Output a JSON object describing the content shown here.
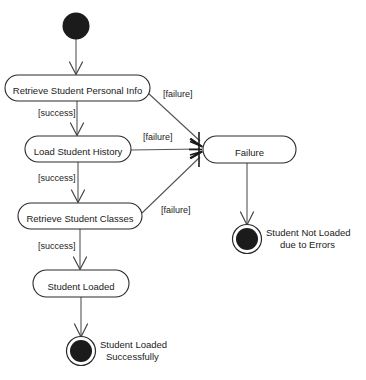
{
  "diagram": {
    "type": "uml-activity-diagram",
    "colors": {
      "background": "#ffffff",
      "node_fill": "#ffffff",
      "node_stroke": "#2a2a2a",
      "flow_stroke": "#555555",
      "solid_node": "#1b1b1b",
      "text": "#1a1a1a"
    },
    "start_node": {
      "name": "initial-node",
      "cx": 76,
      "cy": 26,
      "r": 13.5
    },
    "activities": [
      {
        "id": "retrieve-personal-info",
        "label": "Retrieve Student Personal Info",
        "x": 5,
        "y": 75,
        "w": 145,
        "h": 26
      },
      {
        "id": "load-student-history",
        "label": "Load Student History",
        "x": 25,
        "y": 136,
        "w": 106,
        "h": 26
      },
      {
        "id": "retrieve-student-classes",
        "label": "Retrieve Student Classes",
        "x": 18,
        "y": 203,
        "w": 124,
        "h": 26
      },
      {
        "id": "student-loaded",
        "label": "Student Loaded",
        "x": 33,
        "y": 270,
        "w": 96,
        "h": 27
      },
      {
        "id": "failure",
        "label": "Failure",
        "x": 203,
        "y": 136,
        "w": 93,
        "h": 27
      }
    ],
    "guards": [
      {
        "id": "guard-failure-1",
        "label": "[failure]",
        "x": 163,
        "y": 97
      },
      {
        "id": "guard-success-1",
        "label": "[success]",
        "x": 38,
        "y": 116
      },
      {
        "id": "guard-failure-2",
        "label": "[failure]",
        "x": 143,
        "y": 140
      },
      {
        "id": "guard-success-2",
        "label": "[success]",
        "x": 38,
        "y": 181
      },
      {
        "id": "guard-failure-3",
        "label": "[failure]",
        "x": 161,
        "y": 213
      },
      {
        "id": "guard-success-3",
        "label": "[success]",
        "x": 38,
        "y": 249
      }
    ],
    "end_nodes": [
      {
        "id": "end-error",
        "label_line1": "Student Not Loaded",
        "label_line2": "due to Errors",
        "cx": 247,
        "cy": 239,
        "r_outer": 14.5,
        "r_inner": 11,
        "label_x": 266,
        "label_y1": 236,
        "label_y2": 248
      },
      {
        "id": "end-success",
        "label_line1": "Student Loaded",
        "label_line2": "Successfully",
        "cx": 81,
        "cy": 351,
        "r_outer": 14.5,
        "r_inner": 11,
        "label_x": 100,
        "label_y1": 348,
        "label_y2": 360
      }
    ],
    "flows": [
      {
        "id": "flow-start-to-personal-info",
        "from": "initial-node",
        "to": "retrieve-personal-info",
        "guard": ""
      },
      {
        "id": "flow-personal-info-to-failure",
        "from": "retrieve-personal-info",
        "to": "failure",
        "guard": "[failure]"
      },
      {
        "id": "flow-personal-info-to-history",
        "from": "retrieve-personal-info",
        "to": "load-student-history",
        "guard": "[success]"
      },
      {
        "id": "flow-history-to-failure",
        "from": "load-student-history",
        "to": "failure",
        "guard": "[failure]"
      },
      {
        "id": "flow-history-to-classes",
        "from": "load-student-history",
        "to": "retrieve-student-classes",
        "guard": "[success]"
      },
      {
        "id": "flow-classes-to-failure",
        "from": "retrieve-student-classes",
        "to": "failure",
        "guard": "[failure]"
      },
      {
        "id": "flow-classes-to-loaded",
        "from": "retrieve-student-classes",
        "to": "student-loaded",
        "guard": "[success]"
      },
      {
        "id": "flow-loaded-to-end-success",
        "from": "student-loaded",
        "to": "end-success",
        "guard": ""
      },
      {
        "id": "flow-failure-to-end-error",
        "from": "failure",
        "to": "end-error",
        "guard": ""
      }
    ]
  }
}
